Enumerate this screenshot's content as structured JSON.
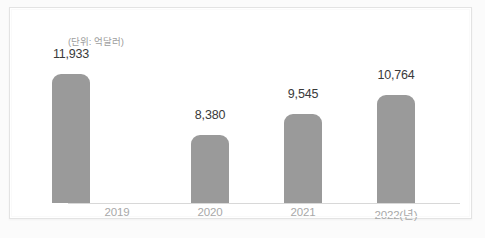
{
  "caption": {
    "unit_note": "(단위: 억달러)"
  },
  "chart_data": {
    "type": "bar",
    "title": "",
    "subtitle": "",
    "xlabel": "",
    "ylabel": "",
    "unit_note": "(단위: 억달러)",
    "categories": [
      "2019",
      "2020",
      "2021",
      "2022(년)"
    ],
    "values": [
      8380,
      9545,
      10764,
      11933
    ],
    "value_labels": [
      "8,380",
      "9,545",
      "10,764",
      "11,933"
    ],
    "series": [
      {
        "name": "",
        "values": [
          8380,
          9545,
          10764,
          11933
        ]
      }
    ],
    "ylim": [
      0,
      13000
    ],
    "grid": false,
    "legend": false,
    "legend_position": "none",
    "bar_color": "#9a9a9a",
    "value_label_color": "#3a3a3a",
    "tick_label_color": "#a8a8a8",
    "axis_line_color": "#d8d8d8",
    "background_color": "#ffffff"
  },
  "bars": [
    {
      "label": "2019",
      "value_label": "8,380",
      "height_px": 68,
      "value_top_px": 86
    },
    {
      "label": "2020",
      "value_label": "9,545",
      "height_px": 89,
      "value_top_px": 65
    },
    {
      "label": "2021",
      "value_label": "10,764",
      "height_px": 108,
      "value_top_px": 46
    },
    {
      "label": "2022(년)",
      "value_label": "11,933",
      "height_px": 129,
      "value_top_px": 25
    }
  ]
}
